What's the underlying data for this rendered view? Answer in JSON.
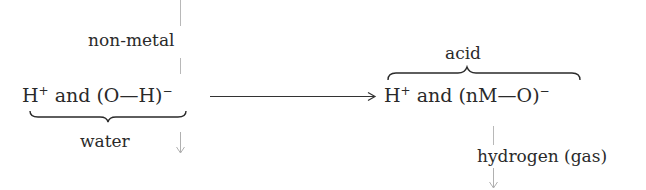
{
  "diagram": {
    "left_node": {
      "formula_parts": [
        "H",
        "+",
        " and (O—H)",
        "−"
      ],
      "top_label": "non-metal",
      "bottom_label": "water"
    },
    "right_node": {
      "formula_parts": [
        "H",
        "+",
        " and (nM—O)",
        "−"
      ],
      "top_label": "acid",
      "bottom_label": "hydrogen (gas)"
    },
    "connector": "arrow from left formula to right formula",
    "colors": {
      "text": "#2a2a2a",
      "arrow": "#333333",
      "flow_line": "#b5b5b5"
    }
  }
}
